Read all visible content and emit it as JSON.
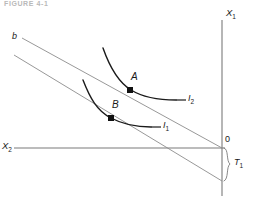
{
  "figure": {
    "caption": "FIGURE 4-1",
    "background_color": "#ffffff",
    "axis_color": "#7a7a7a",
    "budget_line_color": "#8c8c8c",
    "curve_color": "#1a1a1a",
    "label_color": "#1a1a1a"
  },
  "axes": {
    "vertical": {
      "label": "X",
      "subscript": "1",
      "name": "x1-axis"
    },
    "horizontal": {
      "label": "X",
      "subscript": "2",
      "name": "x2-axis"
    },
    "origin": {
      "label": "0"
    }
  },
  "budget_lines": [
    {
      "id": "upper-budget-line",
      "label": "b",
      "subscript": "",
      "description": "pre-tax budget line",
      "x1": 22,
      "y1": 38,
      "x2": 222,
      "y2": 148
    },
    {
      "id": "lower-budget-line",
      "label": "",
      "subscript": "",
      "description": "post-tax budget line, parallel shift",
      "x1": 14,
      "y1": 55,
      "x2": 222,
      "y2": 181
    }
  ],
  "indifference_curves": [
    {
      "id": "curve-i2",
      "label": "I",
      "subscript": "2",
      "description": "higher indifference curve, tangent at A"
    },
    {
      "id": "curve-i1",
      "label": "I",
      "subscript": "1",
      "description": "lower indifference curve, tangent at B"
    }
  ],
  "points": [
    {
      "id": "point-a",
      "label": "A",
      "x": 130,
      "y": 90,
      "description": "tangency of upper budget line with I2"
    },
    {
      "id": "point-b",
      "label": "B",
      "x": 111,
      "y": 118,
      "description": "tangency of lower budget line with I1"
    }
  ],
  "annotations": [
    {
      "id": "tax-bracket",
      "label": "T",
      "subscript": "1",
      "description": "vertical distance between budget lines at the axis"
    }
  ]
}
